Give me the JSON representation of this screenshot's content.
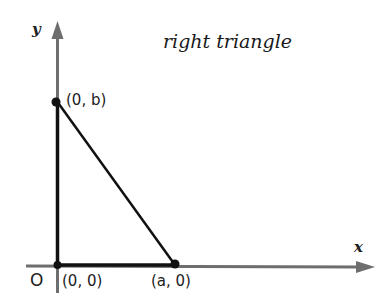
{
  "title": "right triangle",
  "axes": {
    "x_label": "x",
    "y_label": "y",
    "origin_label": "O",
    "axis_color": "#6e6e6e"
  },
  "points": [
    {
      "name": "origin",
      "label": "(0, 0)"
    },
    {
      "name": "y-intercept",
      "label": "(0, b)"
    },
    {
      "name": "x-intercept",
      "label": "(a, 0)"
    }
  ],
  "triangle": {
    "line_color": "#111111",
    "vertices": [
      "(0, 0)",
      "(0, b)",
      "(a, 0)"
    ]
  }
}
